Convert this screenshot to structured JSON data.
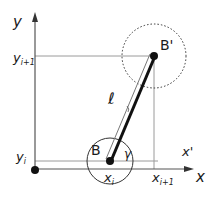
{
  "diagram": {
    "axes": {
      "x_label": "x",
      "y_label": "y"
    },
    "points": {
      "B": {
        "label": "B"
      },
      "B_prime": {
        "label": "B'"
      }
    },
    "rod_label": "ℓ",
    "angle_label": "γ",
    "local_axis_label": "x'",
    "ticks": {
      "x_i": {
        "base": "x",
        "sub": "i"
      },
      "x_i1": {
        "base": "x",
        "sub": "i+1"
      },
      "y_i": {
        "base": "y",
        "sub": "i"
      },
      "y_i1": {
        "base": "y",
        "sub": "i+1"
      }
    },
    "colors": {
      "axis": "#555555",
      "guide": "#9a9a9a",
      "rod": "#111111",
      "point": "#111111",
      "circle": "#333333"
    }
  }
}
